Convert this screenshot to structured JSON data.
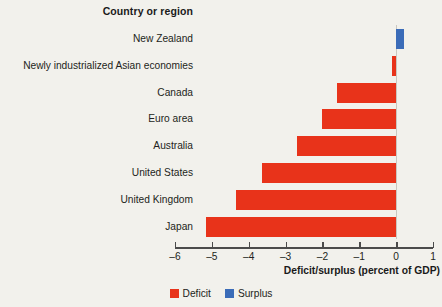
{
  "header": {
    "column_title": "Country or region"
  },
  "axis": {
    "title": "Deficit/surplus (percent of GDP)",
    "tick_labels": [
      "–6",
      "–5",
      "–4",
      "–3",
      "–2",
      "–1",
      "0",
      "1"
    ]
  },
  "legend": {
    "items": [
      {
        "label": "Deficit",
        "color": "#e8331a",
        "key": "deficit"
      },
      {
        "label": "Surplus",
        "color": "#3b6cb8",
        "key": "surplus"
      }
    ]
  },
  "chart_data": {
    "type": "bar",
    "orientation": "horizontal",
    "title": "",
    "xlabel": "Deficit/surplus (percent of GDP)",
    "ylabel": "Country or region",
    "xlim": [
      -6,
      1
    ],
    "xticks": [
      -6,
      -5,
      -4,
      -3,
      -2,
      -1,
      0,
      1
    ],
    "grid": false,
    "legend_position": "bottom-center",
    "categories": [
      "New Zealand",
      "Newly industrialized Asian economies",
      "Canada",
      "Euro area",
      "Australia",
      "United States",
      "United Kingdom",
      "Japan"
    ],
    "values": [
      0.2,
      -0.1,
      -1.6,
      -2.0,
      -2.7,
      -3.65,
      -4.35,
      -5.15
    ],
    "colors": [
      "#3b6cb8",
      "#e8331a",
      "#e8331a",
      "#e8331a",
      "#e8331a",
      "#e8331a",
      "#e8331a",
      "#e8331a"
    ],
    "series": [
      {
        "name": "Deficit/surplus",
        "values": [
          0.2,
          -0.1,
          -1.6,
          -2.0,
          -2.7,
          -3.65,
          -4.35,
          -5.15
        ]
      }
    ]
  }
}
